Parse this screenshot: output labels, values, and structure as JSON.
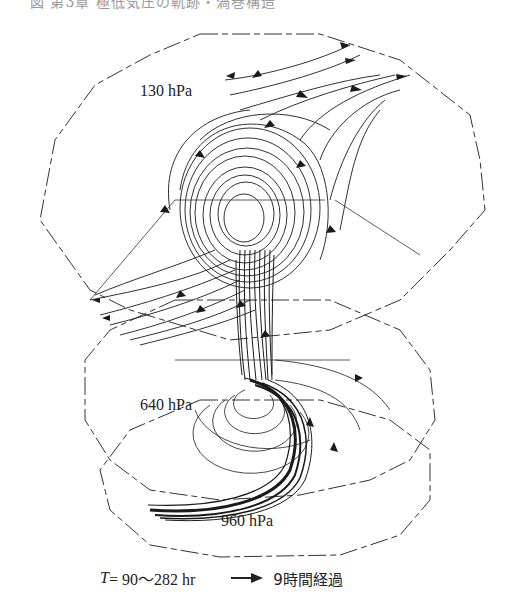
{
  "caption_cut_top": "図 第3章 極低気圧の軌跡・渦巻構造",
  "levels": [
    {
      "label": "130 hPa",
      "x": 140,
      "y": 91
    },
    {
      "label": "640 hPa",
      "x": 140,
      "y": 395
    },
    {
      "label": "960 hPa",
      "x": 221,
      "y": 512
    }
  ],
  "legend": {
    "time_var": "T",
    "time_range": " = 90～282 hr",
    "arrow_meaning": "9時間経過"
  },
  "colors": {
    "line": "#1a1a1a",
    "outline": "#333333",
    "background": "#ffffff"
  }
}
